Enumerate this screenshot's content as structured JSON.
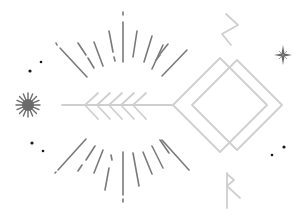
{
  "illustration": {
    "title": "",
    "style": "boho line art",
    "colors": {
      "background": "#ffffff",
      "rays": "#7a7a7a",
      "light_lines": "#cfcfcf",
      "sunburst": "#6b6b6b",
      "dots": "#1a1a1a"
    },
    "elements": [
      {
        "name": "sun-rays-top",
        "count": 11
      },
      {
        "name": "sun-rays-bottom",
        "count": 11
      },
      {
        "name": "arrow",
        "fletching_chevrons": 5
      },
      {
        "name": "double-diamond"
      },
      {
        "name": "rune-top-zigzag"
      },
      {
        "name": "rune-bottom-raido"
      },
      {
        "name": "sunburst-icon"
      },
      {
        "name": "four-point-star-icon"
      },
      {
        "name": "dot-pairs",
        "count": 3
      }
    ]
  }
}
